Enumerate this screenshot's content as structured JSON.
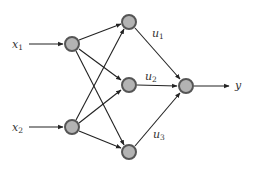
{
  "diagram": {
    "type": "neural-network",
    "colors": {
      "node_fill": "#b3b3b3",
      "node_stroke": "#555555",
      "edge": "#222222",
      "label": "#333333"
    },
    "inputs": [
      {
        "id": "x1",
        "label": "x",
        "sub": "1"
      },
      {
        "id": "x2",
        "label": "x",
        "sub": "2"
      }
    ],
    "hidden": [
      {
        "id": "h1",
        "weight_label": "u",
        "sub": "1"
      },
      {
        "id": "h2",
        "weight_label": "u",
        "sub": "2"
      },
      {
        "id": "h3",
        "weight_label": "u",
        "sub": "3"
      }
    ],
    "output": {
      "id": "out",
      "label": "y"
    }
  }
}
